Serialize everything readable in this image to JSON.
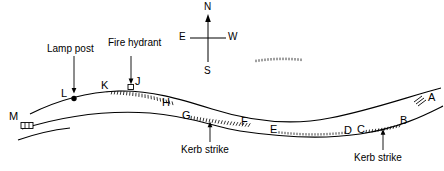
{
  "diagram": {
    "stroke_color": "#000000",
    "background_color": "#ffffff"
  },
  "compass": {
    "north_label": "N",
    "south_label": "S",
    "east_label": "E",
    "west_label": "W"
  },
  "annotations": [
    {
      "id": "lamp-post",
      "label": "Lamp post"
    },
    {
      "id": "fire-hydrant",
      "label": "Fire hydrant"
    },
    {
      "id": "kerb-strike-left",
      "label": "Kerb strike"
    },
    {
      "id": "kerb-strike-right",
      "label": "Kerb strike"
    }
  ],
  "points": [
    {
      "id": "A",
      "label": "A"
    },
    {
      "id": "B",
      "label": "B"
    },
    {
      "id": "C",
      "label": "C"
    },
    {
      "id": "D",
      "label": "D"
    },
    {
      "id": "E",
      "label": "E"
    },
    {
      "id": "F",
      "label": "F"
    },
    {
      "id": "G",
      "label": "G"
    },
    {
      "id": "H",
      "label": "H"
    },
    {
      "id": "J",
      "label": "J"
    },
    {
      "id": "K",
      "label": "K"
    },
    {
      "id": "L",
      "label": "L"
    },
    {
      "id": "M",
      "label": "M"
    }
  ]
}
